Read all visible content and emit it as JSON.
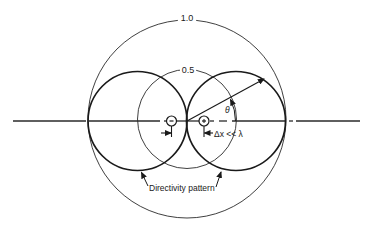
{
  "diagram": {
    "labels": {
      "outer_circle": "1.0",
      "inner_circle": "0.5",
      "angle": "θ",
      "spacing": "Δx << λ",
      "pattern": "Directivity pattern"
    },
    "colors": {
      "stroke": "#1a1a1a",
      "background": "#ffffff"
    },
    "elements": [
      {
        "name": "outer-reference-circle",
        "value": "1.0"
      },
      {
        "name": "inner-reference-circle",
        "value": "0.5"
      },
      {
        "name": "left-lobe",
        "type": "directivity-pattern"
      },
      {
        "name": "right-lobe",
        "type": "directivity-pattern"
      },
      {
        "name": "left-source",
        "type": "point-source"
      },
      {
        "name": "right-source",
        "type": "point-source"
      },
      {
        "name": "radius-arrow"
      },
      {
        "name": "angle-arc",
        "label": "θ"
      },
      {
        "name": "spacing-dimension",
        "label": "Δx << λ"
      }
    ]
  }
}
